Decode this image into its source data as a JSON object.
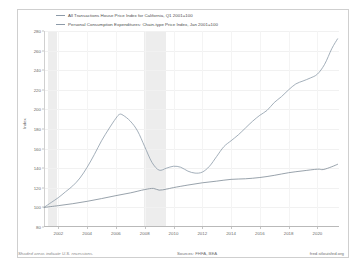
{
  "legend": {
    "items": [
      {
        "label": "All Transactions House Price Index for California, Q1 2001=100",
        "color": "#8c9aa8"
      },
      {
        "label": "Personal Consumption Expenditures: Chain-type Price Index, Jan 2001=100",
        "color": "#8c9aa8"
      }
    ]
  },
  "axis": {
    "ylabel": "Index",
    "yticks": [
      "80",
      "100",
      "120",
      "140",
      "160",
      "180",
      "200",
      "220",
      "240",
      "260",
      "280"
    ],
    "xticks": [
      "2002",
      "2004",
      "2006",
      "2008",
      "2010",
      "2012",
      "2014",
      "2016",
      "2018",
      "2020"
    ]
  },
  "footer": {
    "note": "Shaded areas indicate U.S. recessions.",
    "sources": "Sources: FHFA, BEA",
    "url": "fred.stlouisfed.org"
  },
  "chart_data": {
    "type": "line",
    "title": "",
    "xlabel": "",
    "ylabel": "Index",
    "ylim": [
      80,
      280
    ],
    "xlim": [
      2001.0,
      2021.5
    ],
    "grid": true,
    "legend_position": "top",
    "recessions": [
      {
        "start": 2001.25,
        "end": 2001.9
      },
      {
        "start": 2007.95,
        "end": 2009.45
      }
    ],
    "series": [
      {
        "name": "All Transactions House Price Index for California, Q1 2001=100",
        "color": "#8c9aa8",
        "x": [
          2001.0,
          2001.5,
          2002.0,
          2002.5,
          2003.0,
          2003.5,
          2004.0,
          2004.5,
          2005.0,
          2005.5,
          2006.0,
          2006.25,
          2006.5,
          2007.0,
          2007.5,
          2008.0,
          2008.5,
          2009.0,
          2009.5,
          2010.0,
          2010.5,
          2011.0,
          2011.5,
          2012.0,
          2012.5,
          2013.0,
          2013.5,
          2014.0,
          2014.5,
          2015.0,
          2015.5,
          2016.0,
          2016.5,
          2017.0,
          2017.5,
          2018.0,
          2018.5,
          2019.0,
          2019.5,
          2020.0,
          2020.5,
          2021.0,
          2021.4
        ],
        "y": [
          100,
          105,
          110,
          116,
          122,
          130,
          141,
          154,
          168,
          180,
          191,
          195,
          194,
          188,
          178,
          162,
          146,
          138,
          140,
          142,
          141,
          137,
          135,
          136,
          142,
          152,
          162,
          168,
          174,
          181,
          188,
          194,
          199,
          207,
          213,
          220,
          226,
          229,
          232,
          236,
          246,
          262,
          272
        ]
      },
      {
        "name": "Personal Consumption Expenditures: Chain-type Price Index, Jan 2001=100",
        "color": "#7d8a96",
        "x": [
          2001.0,
          2002.0,
          2003.0,
          2004.0,
          2005.0,
          2006.0,
          2007.0,
          2008.0,
          2008.6,
          2009.0,
          2009.5,
          2010.0,
          2011.0,
          2012.0,
          2013.0,
          2014.0,
          2015.0,
          2016.0,
          2017.0,
          2018.0,
          2019.0,
          2020.0,
          2020.4,
          2021.0,
          2021.4
        ],
        "y": [
          100,
          101.8,
          103.8,
          106.2,
          109.0,
          112.0,
          114.8,
          118.2,
          119.4,
          117.6,
          118.6,
          120.2,
          122.8,
          125.1,
          126.8,
          128.6,
          129.2,
          130.5,
          132.7,
          135.4,
          137.3,
          139.0,
          138.6,
          141.5,
          144.0
        ]
      }
    ]
  }
}
